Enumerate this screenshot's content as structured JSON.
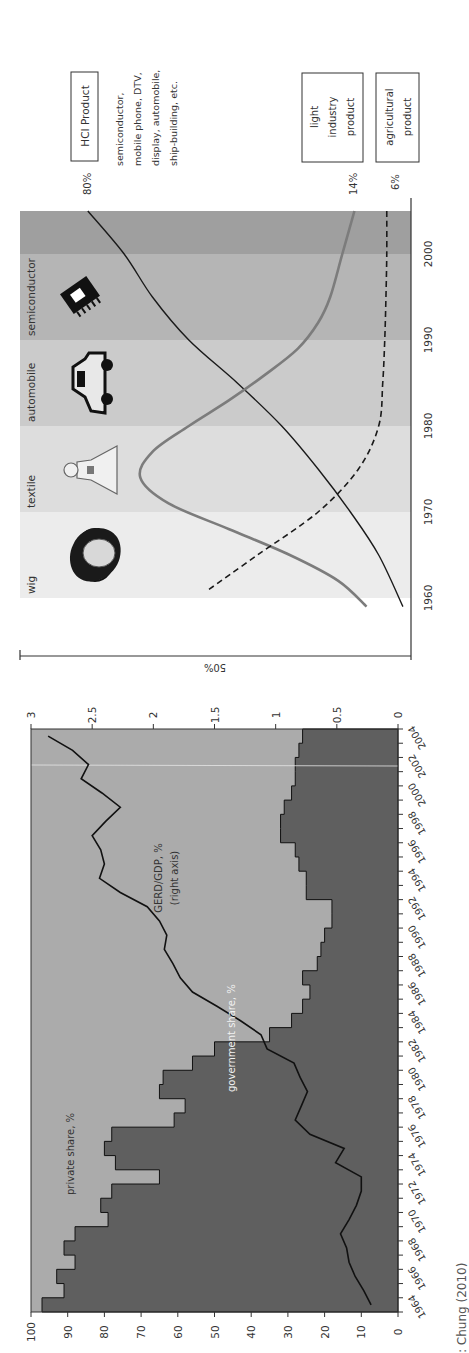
{
  "figure": {
    "orientation": "rotated-90-ccw",
    "source_text": "Source: Chung (2010)",
    "source_visible_text": ": Chung (2010)"
  },
  "colors": {
    "band_1960s": "#ececec",
    "band_1970s": "#dddddd",
    "band_1980s": "#cbcbcb",
    "band_1990s": "#b5b5b5",
    "band_2000s": "#9f9f9f",
    "hci_line": "#1a1a1a",
    "light_line": "#7c7c7c",
    "agri_line": "#1a1a1a",
    "private_area": "#ababab",
    "government_area": "#5f5f5f",
    "gerd_line": "#111111",
    "axis": "#333333"
  },
  "chart_data": [
    {
      "type": "line",
      "title": "Korea's export composition by product type",
      "xlabel": "",
      "ylabel": "50%",
      "x_ticks": [
        1960,
        1970,
        1980,
        1990,
        2000
      ],
      "xlim": [
        1958,
        2005
      ],
      "ylim": [
        0,
        100
      ],
      "bands": [
        {
          "label": "wig",
          "from": 1960,
          "to": 1970
        },
        {
          "label": "textile",
          "from": 1970,
          "to": 1980
        },
        {
          "label": "automobile",
          "from": 1980,
          "to": 1990
        },
        {
          "label": "semiconductor",
          "from": 1990,
          "to": 2000
        },
        {
          "label": "",
          "from": 2000,
          "to": 2005
        }
      ],
      "series": [
        {
          "name": "HCI Product",
          "style": "solid-black",
          "end_label": "80%",
          "description": "semiconductor, mobile phone, DTV, display, automobile, ship-building, etc.",
          "x": [
            1959,
            1965,
            1970,
            1975,
            1980,
            1985,
            1990,
            1995,
            2000,
            2005
          ],
          "values": [
            2,
            8,
            15,
            23,
            32,
            43,
            55,
            64,
            71,
            80
          ]
        },
        {
          "name": "light industry product",
          "style": "solid-gray",
          "end_label": "14%",
          "x": [
            1959,
            1962,
            1965,
            1968,
            1971,
            1974,
            1977,
            1980,
            1983,
            1986,
            1989,
            1992,
            1995,
            2000,
            2005
          ],
          "values": [
            11,
            18,
            30,
            45,
            60,
            67,
            64,
            55,
            45,
            36,
            28,
            23,
            20,
            17,
            14
          ]
        },
        {
          "name": "agricultural product",
          "style": "dashed-black",
          "end_label": "6%",
          "x": [
            1961,
            1965,
            1970,
            1975,
            1980,
            1985,
            1990,
            1995,
            2000,
            2005
          ],
          "values": [
            50,
            38,
            23,
            13,
            8,
            7,
            6.5,
            6.2,
            6,
            6
          ]
        }
      ]
    },
    {
      "type": "area",
      "title": "R&D expenditure shares and GERD/GDP",
      "xlabel": "",
      "ylabel": "%",
      "y2label": "GERD/GDP, %",
      "ylim": [
        0,
        100
      ],
      "y_ticks": [
        0,
        10,
        20,
        30,
        40,
        50,
        60,
        70,
        80,
        90,
        100
      ],
      "y2lim": [
        0,
        3
      ],
      "y2_ticks": [
        "0",
        "0.5",
        "1",
        "1.5",
        "2",
        "2.5",
        "3"
      ],
      "x_tick_labels": [
        "1964",
        "1966",
        "1968",
        "1970",
        "1972",
        "1974",
        "1976",
        "1978",
        "1980",
        "1982",
        "1984",
        "1986",
        "1988",
        "1990",
        "1992",
        "1994",
        "1996",
        "1998",
        "2000",
        "2002",
        "2004"
      ],
      "categories": [
        1964,
        1965,
        1966,
        1967,
        1968,
        1969,
        1970,
        1971,
        1972,
        1973,
        1974,
        1975,
        1976,
        1977,
        1978,
        1979,
        1980,
        1981,
        1982,
        1983,
        1984,
        1985,
        1986,
        1987,
        1988,
        1989,
        1990,
        1991,
        1992,
        1993,
        1994,
        1995,
        1996,
        1997,
        1998,
        1999,
        2000,
        2001,
        2002,
        2003,
        2004
      ],
      "annotations": [
        "private share, %",
        "government share, %",
        "GERD/GDP, %",
        "(right axis)"
      ],
      "series": [
        {
          "name": "government share, %",
          "axis": "left",
          "kind": "step-area",
          "values": [
            97,
            91,
            93,
            88,
            91,
            88,
            79,
            81,
            78,
            65,
            77,
            80,
            78,
            61,
            58,
            65,
            64,
            56,
            50,
            35,
            29,
            26,
            24,
            26,
            22,
            21,
            20,
            18,
            18,
            25,
            25,
            27,
            28,
            32,
            32,
            31,
            29,
            28,
            28,
            27,
            26
          ]
        },
        {
          "name": "private share, %",
          "axis": "left",
          "kind": "step-area",
          "values": [
            3,
            9,
            7,
            12,
            9,
            12,
            21,
            19,
            22,
            35,
            23,
            20,
            22,
            39,
            42,
            35,
            36,
            44,
            50,
            65,
            71,
            74,
            76,
            74,
            78,
            79,
            80,
            82,
            82,
            75,
            75,
            73,
            72,
            68,
            68,
            69,
            71,
            72,
            72,
            73,
            74
          ]
        },
        {
          "name": "GERD/GDP, % (right axis)",
          "axis": "right",
          "kind": "line",
          "values": [
            0.22,
            0.28,
            0.35,
            0.4,
            0.42,
            0.47,
            0.4,
            0.34,
            0.3,
            0.3,
            0.51,
            0.44,
            0.72,
            0.84,
            0.79,
            0.74,
            0.8,
            0.85,
            1.07,
            1.12,
            1.29,
            1.48,
            1.68,
            1.78,
            1.84,
            1.91,
            1.89,
            1.95,
            2.05,
            2.27,
            2.44,
            2.4,
            2.43,
            2.5,
            2.39,
            2.27,
            2.42,
            2.59,
            2.53,
            2.66,
            2.86
          ]
        }
      ]
    }
  ]
}
